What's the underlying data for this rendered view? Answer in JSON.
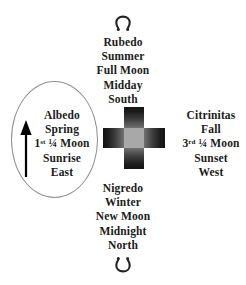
{
  "diagram": {
    "background_color": "#ffffff",
    "text_color": "#1b1b1b",
    "ellipse_stroke_color": "#8e8e8e",
    "cross_dark_color": "#131313",
    "cross_light_color": "#a8a8a8",
    "arrow_color": "#000000"
  },
  "symbols": {
    "top": {
      "name": "omega-horseshoe-symbol",
      "glyph": "Ω"
    },
    "bottom": {
      "name": "inverted-omega-horseshoe-symbol",
      "glyph": "℧"
    }
  },
  "quadrants": {
    "top": {
      "position": "top",
      "stage": "Rubedo",
      "season": "Summer",
      "moon_phase": "Full Moon",
      "time_of_day": "Midday",
      "direction": "South",
      "lines": [
        {
          "text": "Rubedo"
        },
        {
          "text": "Summer"
        },
        {
          "text": "Full Moon"
        },
        {
          "text": "Midday"
        },
        {
          "text": "South"
        }
      ]
    },
    "left": {
      "position": "left",
      "stage": "Albedo",
      "season": "Spring",
      "moon_phase": "1st ¼ Moon",
      "time_of_day": "Sunrise",
      "direction": "East",
      "lines": [
        {
          "text": "Albedo"
        },
        {
          "text": "Spring"
        },
        {
          "text": "1",
          "sup": "st",
          "rest": " ¼ Moon"
        },
        {
          "text": "Sunrise"
        },
        {
          "text": "East"
        }
      ]
    },
    "right": {
      "position": "right",
      "stage": "Citrinitas",
      "season": "Fall",
      "moon_phase": "3rd ¼ Moon",
      "time_of_day": "Sunset",
      "direction": "West",
      "lines": [
        {
          "text": "Citrinitas"
        },
        {
          "text": "Fall"
        },
        {
          "text": "3",
          "sup": "rd",
          "rest": " ¼ Moon"
        },
        {
          "text": "Sunset"
        },
        {
          "text": "West"
        }
      ]
    },
    "bottom": {
      "position": "bottom",
      "stage": "Nigredo",
      "season": "Winter",
      "moon_phase": "New Moon",
      "time_of_day": "Midnight",
      "direction": "North",
      "lines": [
        {
          "text": "Nigredo"
        },
        {
          "text": "Winter"
        },
        {
          "text": "New Moon"
        },
        {
          "text": "Midnight"
        },
        {
          "text": "North"
        }
      ]
    }
  }
}
